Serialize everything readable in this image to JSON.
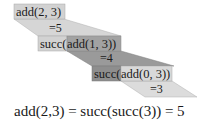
{
  "diagram": {
    "steps": [
      {
        "call": "add(2, 3)",
        "result": "=5"
      },
      {
        "prefix": "succ(",
        "call": "add(1, 3))",
        "result": "=4"
      },
      {
        "prefix": "succ(",
        "call": "add(0, 3))",
        "result": "=3"
      }
    ],
    "equation": "add(2,3) = succ(succ(3)) = 5"
  },
  "colors": {
    "light": "#d6d6d6",
    "dark": "#9a9a9a",
    "text": "#1a1a1a",
    "background": "#ffffff"
  }
}
